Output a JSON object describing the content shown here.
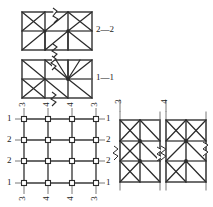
{
  "drawing": {
    "type": "structural-bracing-detail",
    "stroke_color": "#2b2b2b",
    "member_color": "#555555",
    "background": "#ffffff"
  },
  "sections": {
    "top_panel": {
      "label": "2—2",
      "name": "section-2-2",
      "bays": 3,
      "stories": 2
    },
    "middle_panel": {
      "label": "1—1",
      "name": "section-1-1",
      "bays": 3,
      "stories": 2
    }
  },
  "plan": {
    "name": "plan-grid",
    "columns": 3,
    "rows": 3,
    "left_labels": [
      "1",
      "2",
      "2",
      "1"
    ],
    "right_labels": [
      "1",
      "2",
      "2",
      "1"
    ],
    "top_labels": [
      "3",
      "4",
      "4",
      "3"
    ],
    "bottom_labels": [
      "3",
      "4",
      "4",
      "3"
    ],
    "node_marker": "column-square"
  },
  "elevations": [
    {
      "name": "elevation-3",
      "label": "3",
      "bays": 2,
      "stories": 3
    },
    {
      "name": "elevation-4",
      "label": "4",
      "bays": 2,
      "stories": 3
    }
  ],
  "annotations": {
    "break_symbol": "zigzag-break",
    "dash": "—"
  }
}
